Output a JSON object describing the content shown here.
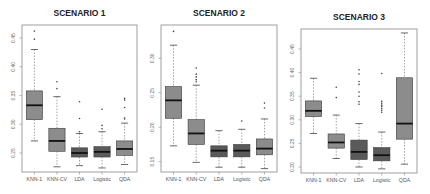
{
  "colors": {
    "box_light": "#8c8c8c",
    "box_dark": "#5a5a5a",
    "median": "#111111",
    "frame": "#888888",
    "whisker": "#666666",
    "outlier": "#444444"
  },
  "chart_data": [
    {
      "type": "boxplot",
      "title": "SCENARIO 1",
      "xlabel": "",
      "ylabel": "",
      "categories": [
        "KNN-1",
        "KNN-CV",
        "LDA",
        "Logistic",
        "QDA"
      ],
      "yticks": [
        0.25,
        0.3,
        0.35,
        0.4,
        0.45
      ],
      "ylim": [
        0.215,
        0.47
      ],
      "frame": {
        "x0": 22,
        "x1": 137,
        "y0": 25,
        "y1": 172
      },
      "tick_px": {
        "top_value": 0.45,
        "top_y": 38,
        "bottom_value": 0.25,
        "bottom_y": 153
      },
      "series": [
        {
          "name": "KNN-1",
          "shade": "light",
          "whisker_low": 0.271,
          "q1": 0.308,
          "median": 0.333,
          "q3": 0.358,
          "whisker_high": 0.43,
          "outliers": [
            0.448,
            0.462
          ]
        },
        {
          "name": "KNN-CV",
          "shade": "light",
          "whisker_low": 0.226,
          "q1": 0.253,
          "median": 0.271,
          "q3": 0.293,
          "whisker_high": 0.348,
          "outliers": [
            0.362,
            0.374
          ]
        },
        {
          "name": "LDA",
          "shade": "dark",
          "whisker_low": 0.228,
          "q1": 0.243,
          "median": 0.25,
          "q3": 0.259,
          "whisker_high": 0.284,
          "outliers": [
            0.287,
            0.31,
            0.339
          ]
        },
        {
          "name": "Logistic",
          "shade": "dark",
          "whisker_low": 0.224,
          "q1": 0.243,
          "median": 0.252,
          "q3": 0.261,
          "whisker_high": 0.287,
          "outliers": [
            0.292,
            0.298,
            0.326
          ]
        },
        {
          "name": "QDA",
          "shade": "light",
          "whisker_low": 0.23,
          "q1": 0.246,
          "median": 0.257,
          "q3": 0.271,
          "whisker_high": 0.302,
          "outliers": [
            0.309,
            0.311,
            0.329,
            0.342,
            0.345
          ]
        }
      ]
    },
    {
      "type": "boxplot",
      "title": "SCENARIO 2",
      "xlabel": "",
      "ylabel": "",
      "categories": [
        "KNN-1",
        "KNN-CV",
        "LDA",
        "Logistic",
        "QDA"
      ],
      "yticks": [
        0.15,
        0.2,
        0.25,
        0.3
      ],
      "ylim": [
        0.135,
        0.345
      ],
      "frame": {
        "x0": 161,
        "x1": 277,
        "y0": 25,
        "y1": 172
      },
      "tick_px": {
        "top_value": 0.3,
        "top_y": 58.3,
        "bottom_value": 0.15,
        "bottom_y": 161.7
      },
      "series": [
        {
          "name": "KNN-1",
          "shade": "light",
          "whisker_low": 0.173,
          "q1": 0.213,
          "median": 0.239,
          "q3": 0.259,
          "whisker_high": 0.319,
          "outliers": [
            0.339
          ]
        },
        {
          "name": "KNN-CV",
          "shade": "light",
          "whisker_low": 0.149,
          "q1": 0.175,
          "median": 0.191,
          "q3": 0.211,
          "whisker_high": 0.261,
          "outliers": [
            0.266,
            0.269,
            0.273,
            0.277,
            0.286
          ]
        },
        {
          "name": "LDA",
          "shade": "dark",
          "whisker_low": 0.142,
          "q1": 0.157,
          "median": 0.166,
          "q3": 0.173,
          "whisker_high": 0.195,
          "outliers": []
        },
        {
          "name": "Logistic",
          "shade": "dark",
          "whisker_low": 0.142,
          "q1": 0.157,
          "median": 0.166,
          "q3": 0.175,
          "whisker_high": 0.197,
          "outliers": [
            0.209
          ]
        },
        {
          "name": "QDA",
          "shade": "light",
          "whisker_low": 0.14,
          "q1": 0.16,
          "median": 0.169,
          "q3": 0.183,
          "whisker_high": 0.212,
          "outliers": [
            0.228,
            0.235
          ]
        }
      ]
    },
    {
      "type": "boxplot",
      "title": "SCENARIO 3",
      "xlabel": "",
      "ylabel": "",
      "categories": [
        "KNN-1",
        "KNN-CV",
        "LDA",
        "Logistic",
        "QDA"
      ],
      "yticks": [
        0.2,
        0.25,
        0.3,
        0.35,
        0.4,
        0.45
      ],
      "ylim": [
        0.19,
        0.49
      ],
      "frame": {
        "x0": 301,
        "x1": 417,
        "y0": 29,
        "y1": 173
      },
      "tick_px": {
        "top_value": 0.45,
        "top_y": 49,
        "bottom_value": 0.2,
        "bottom_y": 167
      },
      "series": [
        {
          "name": "KNN-1",
          "shade": "light",
          "whisker_low": 0.271,
          "q1": 0.307,
          "median": 0.319,
          "q3": 0.34,
          "whisker_high": 0.388,
          "outliers": []
        },
        {
          "name": "KNN-CV",
          "shade": "light",
          "whisker_low": 0.218,
          "q1": 0.24,
          "median": 0.252,
          "q3": 0.27,
          "whisker_high": 0.31,
          "outliers": [
            0.347,
            0.369
          ]
        },
        {
          "name": "LDA",
          "shade": "dark",
          "whisker_low": 0.2,
          "q1": 0.216,
          "median": 0.232,
          "q3": 0.257,
          "whisker_high": 0.292,
          "outliers": [
            0.333,
            0.338,
            0.35,
            0.359,
            0.375,
            0.381,
            0.397,
            0.406
          ]
        },
        {
          "name": "Logistic",
          "shade": "dark",
          "whisker_low": 0.196,
          "q1": 0.213,
          "median": 0.225,
          "q3": 0.241,
          "whisker_high": 0.274,
          "outliers": [
            0.316,
            0.32,
            0.324,
            0.328,
            0.331,
            0.335,
            0.339,
            0.398
          ]
        },
        {
          "name": "QDA",
          "shade": "light",
          "whisker_low": 0.206,
          "q1": 0.259,
          "median": 0.292,
          "q3": 0.389,
          "whisker_high": 0.484,
          "outliers": []
        }
      ]
    }
  ]
}
